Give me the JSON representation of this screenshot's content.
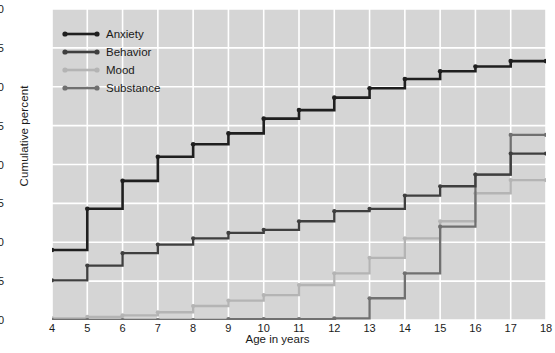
{
  "chart_data": {
    "type": "line",
    "step": "post",
    "title": "",
    "xlabel": "Age in years",
    "ylabel": "Cumulative percent",
    "xlim": [
      4,
      18
    ],
    "ylim": [
      0,
      40
    ],
    "xticks": [
      4,
      5,
      6,
      7,
      8,
      9,
      10,
      11,
      12,
      13,
      14,
      15,
      16,
      17,
      18
    ],
    "yticks": [
      0,
      5,
      10,
      15,
      20,
      25,
      30,
      35,
      40
    ],
    "grid": true,
    "legend_position": "upper-left-inside",
    "x": [
      4,
      5,
      6,
      7,
      8,
      9,
      10,
      11,
      12,
      13,
      14,
      15,
      16,
      17,
      18
    ],
    "series": [
      {
        "name": "Anxiety",
        "color": "#1f1f1f",
        "values": [
          9.0,
          14.3,
          17.9,
          21.0,
          22.6,
          24.0,
          25.9,
          27.0,
          28.6,
          29.8,
          31.0,
          32.0,
          32.6,
          33.3,
          33.3
        ]
      },
      {
        "name": "Behavior",
        "color": "#3f3f3f",
        "values": [
          5.1,
          7.0,
          8.6,
          9.7,
          10.5,
          11.2,
          11.6,
          12.7,
          14.0,
          14.3,
          16.0,
          17.2,
          18.7,
          21.4,
          21.4
        ]
      },
      {
        "name": "Mood",
        "color": "#b4b4b4",
        "values": [
          0.2,
          0.4,
          0.6,
          1.0,
          1.8,
          2.5,
          3.2,
          4.5,
          6.0,
          8.0,
          10.5,
          12.7,
          16.3,
          18.0,
          18.0
        ]
      },
      {
        "name": "Substance",
        "color": "#707070",
        "values": [
          0.0,
          0.0,
          0.0,
          0.0,
          0.0,
          0.1,
          0.1,
          0.1,
          0.2,
          2.8,
          6.0,
          12.0,
          18.7,
          23.8,
          23.8
        ]
      }
    ]
  },
  "legend": {
    "items": [
      {
        "label": "Anxiety"
      },
      {
        "label": "Behavior"
      },
      {
        "label": "Mood"
      },
      {
        "label": "Substance"
      }
    ]
  },
  "axes": {
    "y_title": "Cumulative percent",
    "x_title": "Age in years",
    "y_tick_labels": [
      "40",
      "35",
      "30",
      "25",
      "20",
      "15",
      "10",
      "5",
      "0"
    ],
    "x_tick_labels": [
      "4",
      "5",
      "6",
      "7",
      "8",
      "9",
      "10",
      "11",
      "12",
      "13",
      "14",
      "15",
      "16",
      "17",
      "18"
    ]
  },
  "style": {
    "plot_background": "#d5d5d5",
    "gridline_color": "#ffffff",
    "page_background": "#ffffff",
    "text_color": "#1a1a1a"
  }
}
